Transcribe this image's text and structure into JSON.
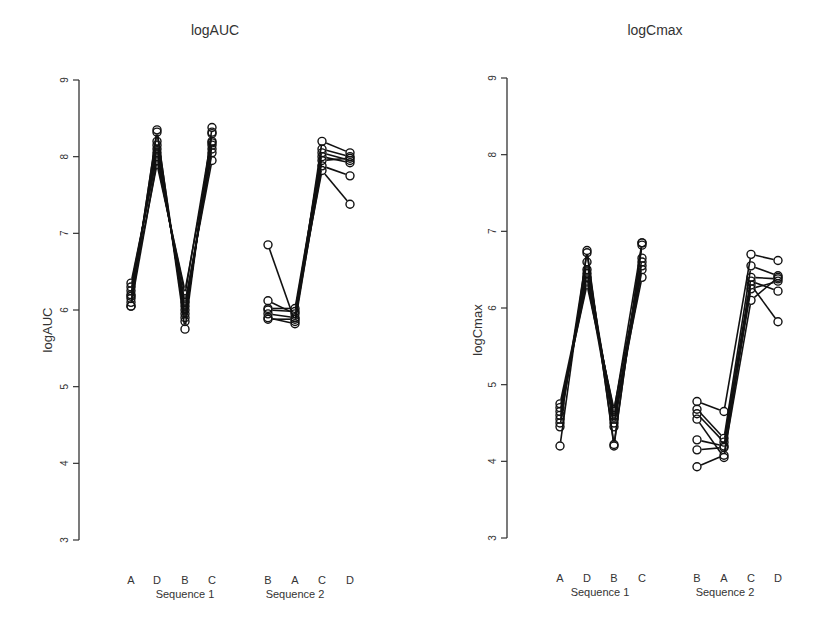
{
  "chart_data": [
    {
      "type": "line",
      "subtype": "spaghetti-profile",
      "title": "logAUC",
      "ylabel": "logAUC",
      "xlabel": "",
      "ylim": [
        3,
        9
      ],
      "yticks": [
        3,
        4,
        5,
        6,
        7,
        8,
        9
      ],
      "grid": false,
      "legend": null,
      "groups": [
        {
          "label": "Sequence 1",
          "categories": [
            "A",
            "D",
            "B",
            "C"
          ]
        },
        {
          "label": "Sequence 2",
          "categories": [
            "B",
            "A",
            "C",
            "D"
          ]
        }
      ],
      "series": [
        {
          "group": "Sequence 1",
          "values": [
            6.05,
            8.35,
            5.75,
            8.38
          ]
        },
        {
          "group": "Sequence 1",
          "values": [
            6.1,
            8.32,
            5.85,
            8.32
          ]
        },
        {
          "group": "Sequence 1",
          "values": [
            6.15,
            8.2,
            5.9,
            8.2
          ]
        },
        {
          "group": "Sequence 1",
          "values": [
            6.2,
            8.15,
            5.95,
            8.18
          ]
        },
        {
          "group": "Sequence 1",
          "values": [
            6.25,
            8.1,
            6.0,
            8.1
          ]
        },
        {
          "group": "Sequence 1",
          "values": [
            6.3,
            8.05,
            6.05,
            8.05
          ]
        },
        {
          "group": "Sequence 1",
          "values": [
            6.35,
            8.0,
            6.1,
            7.95
          ]
        },
        {
          "group": "Sequence 1",
          "values": [
            6.05,
            7.95,
            6.2,
            8.3
          ]
        },
        {
          "group": "Sequence 1",
          "values": [
            6.18,
            7.9,
            6.25,
            8.15
          ]
        },
        {
          "group": "Sequence 2",
          "values": [
            6.85,
            5.85,
            8.2,
            8.05
          ]
        },
        {
          "group": "Sequence 2",
          "values": [
            6.12,
            5.95,
            8.1,
            8.0
          ]
        },
        {
          "group": "Sequence 2",
          "values": [
            6.02,
            6.02,
            8.05,
            7.95
          ]
        },
        {
          "group": "Sequence 2",
          "values": [
            5.95,
            5.9,
            8.0,
            7.92
          ]
        },
        {
          "group": "Sequence 2",
          "values": [
            5.9,
            5.82,
            7.95,
            7.98
          ]
        },
        {
          "group": "Sequence 2",
          "values": [
            5.88,
            5.88,
            7.88,
            7.75
          ]
        },
        {
          "group": "Sequence 2",
          "values": [
            6.0,
            5.98,
            7.82,
            7.38
          ]
        }
      ]
    },
    {
      "type": "line",
      "subtype": "spaghetti-profile",
      "title": "logCmax",
      "ylabel": "logCmax",
      "xlabel": "",
      "ylim": [
        3,
        9
      ],
      "yticks": [
        3,
        4,
        5,
        6,
        7,
        8,
        9
      ],
      "grid": false,
      "legend": null,
      "groups": [
        {
          "label": "Sequence 1",
          "categories": [
            "A",
            "D",
            "B",
            "C"
          ]
        },
        {
          "label": "Sequence 2",
          "categories": [
            "B",
            "A",
            "C",
            "D"
          ]
        }
      ],
      "series": [
        {
          "group": "Sequence 1",
          "values": [
            4.2,
            6.75,
            4.2,
            6.85
          ]
        },
        {
          "group": "Sequence 1",
          "values": [
            4.45,
            6.72,
            4.22,
            6.82
          ]
        },
        {
          "group": "Sequence 1",
          "values": [
            4.5,
            6.6,
            4.5,
            6.65
          ]
        },
        {
          "group": "Sequence 1",
          "values": [
            4.55,
            6.5,
            4.55,
            6.55
          ]
        },
        {
          "group": "Sequence 1",
          "values": [
            4.6,
            6.45,
            4.6,
            6.4
          ]
        },
        {
          "group": "Sequence 1",
          "values": [
            4.65,
            6.35,
            4.65,
            6.85
          ]
        },
        {
          "group": "Sequence 1",
          "values": [
            4.7,
            6.3,
            4.68,
            6.6
          ]
        },
        {
          "group": "Sequence 1",
          "values": [
            4.75,
            6.4,
            4.45,
            6.5
          ]
        },
        {
          "group": "Sequence 2",
          "values": [
            4.78,
            4.65,
            6.7,
            6.62
          ]
        },
        {
          "group": "Sequence 2",
          "values": [
            4.68,
            4.3,
            6.55,
            6.42
          ]
        },
        {
          "group": "Sequence 2",
          "values": [
            4.62,
            4.25,
            6.4,
            6.38
          ]
        },
        {
          "group": "Sequence 2",
          "values": [
            4.55,
            4.05,
            6.35,
            6.22
          ]
        },
        {
          "group": "Sequence 2",
          "values": [
            4.28,
            4.2,
            6.3,
            5.82
          ]
        },
        {
          "group": "Sequence 2",
          "values": [
            4.15,
            4.18,
            6.25,
            6.35
          ]
        },
        {
          "group": "Sequence 2",
          "values": [
            3.93,
            4.08,
            6.1,
            6.4
          ]
        }
      ]
    }
  ]
}
